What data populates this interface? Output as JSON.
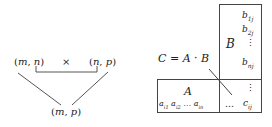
{
  "left_diagram": {
    "left_dim": "(m, n)",
    "operator": "×",
    "right_dim": "(n, p)",
    "result_dim": "(m, p)"
  },
  "right_diagram": {
    "equation": "C = A · B",
    "matrix_b": {
      "label": "B",
      "entries": [
        "b1j",
        "b2j",
        "⋮",
        "bnj"
      ]
    },
    "matrix_a": {
      "label": "A",
      "row": [
        "ai1",
        "ai2",
        "…",
        "ain"
      ]
    },
    "matrix_c": {
      "vdots": "⋮",
      "hdots": "…",
      "entry": "cij"
    }
  },
  "colors": {
    "line": "#444444",
    "text": "#222222",
    "background": "#ffffff"
  }
}
